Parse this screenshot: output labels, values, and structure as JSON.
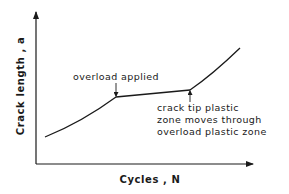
{
  "diagram": {
    "x_axis_label": "Cycles , N",
    "y_axis_label": "Crack length , a",
    "annotations": {
      "overload": "overload applied",
      "plastic_zone_lines": [
        "crack tip plastic",
        "zone moves through",
        "overload plastic zone"
      ]
    },
    "curve_points": [
      [
        45,
        137
      ],
      [
        70,
        126
      ],
      [
        95,
        111
      ],
      [
        116,
        97
      ],
      [
        190,
        90
      ],
      [
        215,
        72
      ],
      [
        240,
        48
      ]
    ],
    "colors": {
      "line": "#1a1a1a",
      "background": "#ffffff"
    }
  }
}
